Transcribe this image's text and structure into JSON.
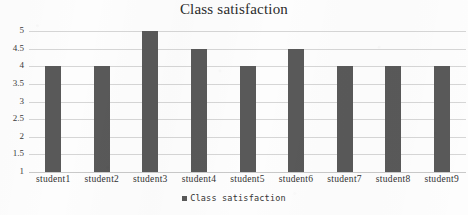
{
  "chart_data": {
    "type": "bar",
    "title": "Class satisfaction",
    "xlabel": "",
    "ylabel": "",
    "categories": [
      "student1",
      "student2",
      "student3",
      "student4",
      "student5",
      "student6",
      "student7",
      "student8",
      "student9"
    ],
    "values": [
      4,
      4,
      5,
      4.5,
      4,
      4.5,
      4,
      4,
      4
    ],
    "series": [
      {
        "name": "Class satisfaction",
        "values": [
          4,
          4,
          5,
          4.5,
          4,
          4.5,
          4,
          4,
          4
        ]
      }
    ],
    "ylim": [
      1,
      5
    ],
    "ytick_labels": [
      "5",
      "4.5",
      "4",
      "3.5",
      "3",
      "2.5",
      "2",
      "1.5",
      "1"
    ],
    "ytick_values": [
      5,
      4.5,
      4,
      3.5,
      3,
      2.5,
      2,
      1.5,
      1
    ],
    "grid": true,
    "legend": {
      "position": "bottom",
      "entries": [
        "Class satisfaction"
      ]
    },
    "colors": {
      "bar": "#595959",
      "gridline": "#d6d6d6",
      "background": "#fdfdfd",
      "text": "#303030"
    }
  },
  "legend": {
    "label": "Class satisfaction",
    "marker": "legend-marker-square"
  }
}
